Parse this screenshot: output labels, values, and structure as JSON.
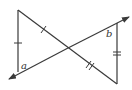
{
  "diagram": {
    "type": "geometry-figure",
    "labels": {
      "angle_a": "a",
      "angle_b": "b"
    },
    "points": {
      "top_left": [
        18,
        10
      ],
      "bottom_left": [
        18,
        72
      ],
      "intersection": [
        68,
        48
      ],
      "top_right": [
        117,
        23
      ],
      "bottom_right": [
        117,
        84
      ],
      "arrow_start": [
        10,
        79
      ],
      "arrow_end": [
        129,
        17
      ]
    },
    "congruence_marks": {
      "left_vertical": "single tick",
      "upper_left_diagonal": "single tick",
      "right_vertical": "double tick",
      "lower_right_diagonal": "double tick"
    },
    "stroke_color": "#3a3a3a"
  }
}
